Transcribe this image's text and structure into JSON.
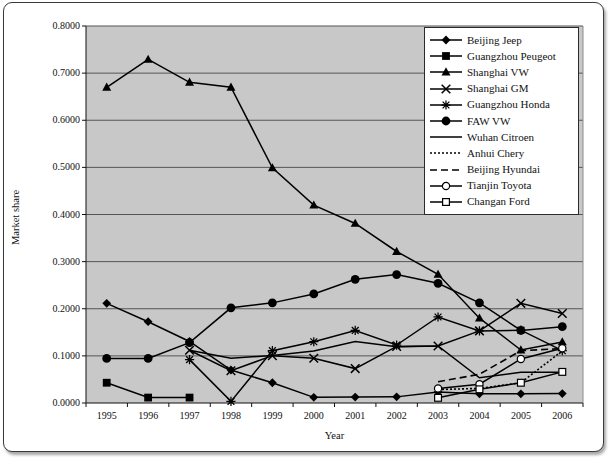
{
  "figure": {
    "title": "",
    "frame_color": "#3a3a3a",
    "plot_bg_color": "#c8c8c8",
    "gridline_color": "#555555",
    "series_color": "#000000"
  },
  "chart_data": {
    "type": "line",
    "title": "",
    "xlabel": "Year",
    "ylabel": "Market share",
    "categories": [
      "1995",
      "1996",
      "1997",
      "1998",
      "1999",
      "2000",
      "2001",
      "2002",
      "2003",
      "2004",
      "2005",
      "2006"
    ],
    "ylim": [
      0.0,
      0.8
    ],
    "ytick_labels": [
      "0.0000",
      "0.1000",
      "0.2000",
      "0.3000",
      "0.4000",
      "0.5000",
      "0.6000",
      "0.7000",
      "0.8000"
    ],
    "ytick_values": [
      0.0,
      0.1,
      0.2,
      0.3,
      0.4,
      0.5,
      0.6,
      0.7,
      0.8
    ],
    "grid": true,
    "legend_position": "top-right",
    "series": [
      {
        "name": "Beijing Jeep",
        "marker": "diamond",
        "line_style": "solid",
        "values": [
          0.2115,
          0.1725,
          0.1305,
          0.07,
          0.043,
          0.012,
          0.0125,
          0.013,
          0.0235,
          0.0195,
          0.0195,
          0.02
        ]
      },
      {
        "name": "Guangzhou Peugeot",
        "marker": "square",
        "line_style": "solid",
        "values": [
          0.043,
          0.0115,
          0.0115,
          null,
          null,
          null,
          null,
          null,
          null,
          null,
          null,
          null
        ]
      },
      {
        "name": "Shanghai VW",
        "marker": "triangle",
        "line_style": "solid",
        "values": [
          0.67,
          0.729,
          0.6805,
          0.67,
          0.499,
          0.42,
          0.381,
          0.3215,
          0.273,
          0.18,
          0.1125,
          0.1295
        ]
      },
      {
        "name": "Shanghai GM",
        "marker": "x",
        "line_style": "solid",
        "values": [
          null,
          null,
          0.112,
          0.0685,
          0.1005,
          0.095,
          0.073,
          0.12,
          0.121,
          0.153,
          0.2115,
          0.19
        ]
      },
      {
        "name": "Guangzhou Honda",
        "marker": "asterisk",
        "line_style": "solid",
        "values": [
          null,
          null,
          0.092,
          0.0035,
          0.111,
          0.13,
          0.154,
          0.123,
          0.1825,
          0.153,
          0.1545,
          0.111
        ]
      },
      {
        "name": "FAW VW",
        "marker": "circle",
        "line_style": "solid",
        "values": [
          0.0945,
          0.0945,
          0.128,
          0.202,
          0.2125,
          0.2315,
          0.2625,
          0.2725,
          0.254,
          0.2125,
          0.154,
          0.162
        ]
      },
      {
        "name": "Wuhan Citroen",
        "marker": "none",
        "line_style": "solid",
        "values": [
          null,
          null,
          0.112,
          0.095,
          0.101,
          0.1105,
          0.1305,
          0.1195,
          0.121,
          0.0535,
          0.065,
          0.065
        ]
      },
      {
        "name": "Anhui Chery",
        "marker": "none",
        "line_style": "dotted",
        "values": [
          null,
          null,
          null,
          null,
          null,
          null,
          null,
          null,
          0.0285,
          0.031,
          0.043,
          0.1105
        ]
      },
      {
        "name": "Beijing Hyundai",
        "marker": "none",
        "line_style": "dashed",
        "values": [
          null,
          null,
          null,
          null,
          null,
          null,
          null,
          null,
          0.045,
          0.061,
          0.111,
          0.1155
        ]
      },
      {
        "name": "Tianjin Toyota",
        "marker": "circle-open",
        "line_style": "solid",
        "values": [
          null,
          null,
          null,
          null,
          null,
          null,
          null,
          null,
          0.031,
          0.04,
          0.0935,
          0.116
        ]
      },
      {
        "name": "Changan Ford",
        "marker": "square-open",
        "line_style": "solid",
        "values": [
          null,
          null,
          null,
          null,
          null,
          null,
          null,
          null,
          0.011,
          0.029,
          0.043,
          0.066
        ]
      }
    ]
  }
}
